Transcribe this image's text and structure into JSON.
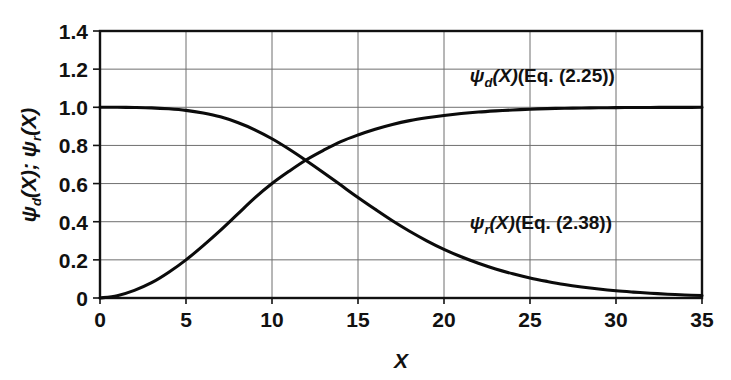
{
  "chart_data": {
    "type": "line",
    "title": "",
    "xlabel": "X",
    "ylabel": "ψd(X); ψr(X)",
    "xlim": [
      0,
      35
    ],
    "ylim": [
      0,
      1.4
    ],
    "grid": true,
    "legend_position": "inline-annotation",
    "x_ticks": [
      "0",
      "5",
      "10",
      "15",
      "20",
      "25",
      "30",
      "35"
    ],
    "x_tick_values": [
      0,
      5,
      10,
      15,
      20,
      25,
      30,
      35
    ],
    "y_ticks": [
      "0",
      "0.2",
      "0.4",
      "0.6",
      "0.8",
      "1.0",
      "1.2",
      "1.4"
    ],
    "y_tick_values": [
      0,
      0.2,
      0.4,
      0.6,
      0.8,
      1.0,
      1.2,
      1.4
    ],
    "x": [
      0,
      1,
      2,
      3,
      4,
      5,
      6,
      7,
      8,
      9,
      10,
      11,
      12,
      13,
      14,
      15,
      16,
      17,
      18,
      19,
      20,
      21,
      22,
      23,
      24,
      25,
      26,
      27,
      28,
      29,
      30,
      31,
      32,
      33,
      34,
      35
    ],
    "series": [
      {
        "name": "ψd(X) (Eq. (2.25))",
        "label_symbol": "ψ",
        "label_subscript": "d",
        "label_equation": "(Eq. (2.25))",
        "color": "#0b0b0b",
        "values": [
          0.0,
          0.012,
          0.04,
          0.08,
          0.135,
          0.2,
          0.275,
          0.355,
          0.44,
          0.525,
          0.6,
          0.665,
          0.725,
          0.775,
          0.82,
          0.855,
          0.885,
          0.91,
          0.93,
          0.945,
          0.957,
          0.967,
          0.975,
          0.981,
          0.986,
          0.99,
          0.993,
          0.995,
          0.9965,
          0.9975,
          0.9982,
          0.9988,
          0.9992,
          0.9995,
          0.9997,
          0.9998
        ]
      },
      {
        "name": "ψr(X) (Eq. (2.38))",
        "label_symbol": "ψ",
        "label_subscript": "r",
        "label_equation": "(Eq. (2.38))",
        "color": "#0b0b0b",
        "values": [
          1.0,
          1.0,
          0.999,
          0.997,
          0.992,
          0.984,
          0.97,
          0.95,
          0.92,
          0.882,
          0.835,
          0.78,
          0.72,
          0.657,
          0.592,
          0.527,
          0.465,
          0.405,
          0.35,
          0.3,
          0.255,
          0.216,
          0.182,
          0.152,
          0.127,
          0.105,
          0.087,
          0.071,
          0.058,
          0.047,
          0.038,
          0.031,
          0.025,
          0.02,
          0.016,
          0.013
        ]
      }
    ],
    "annotations": [
      {
        "id": "psi-d-annotation",
        "text": "ψd(X) (Eq. (2.25))",
        "x": 21.5,
        "y": 1.13
      },
      {
        "id": "psi-r-annotation",
        "text": "ψr(X) (Eq. (2.38))",
        "x": 21.5,
        "y": 0.36
      }
    ]
  },
  "axis": {
    "x_title": "X",
    "y_title_part1_symbol": "ψ",
    "y_title_part1_sub": "d",
    "y_title_mid": "(X); ",
    "y_title_part2_symbol": "ψ",
    "y_title_part2_sub": "r",
    "y_title_end": "(X)"
  },
  "labels": {
    "psi": "ψ",
    "sub_d": "d",
    "sub_r": "r",
    "paren_x": "(X)",
    "eq_225": "(Eq. (2.25))",
    "eq_238": "(Eq. (2.38))",
    "semicolon": "; "
  },
  "colors": {
    "curve": "#0b0b0b",
    "grid": "#6f6f6f",
    "frame": "#111111",
    "background": "#ffffff"
  }
}
